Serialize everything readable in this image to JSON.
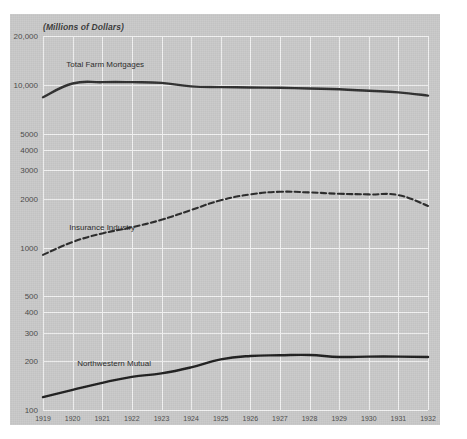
{
  "chart_data": {
    "type": "line",
    "title": "",
    "subtitle": "(Millions of Dollars)",
    "xlabel": "",
    "ylabel": "(Millions of Dollars)",
    "yscale": "log",
    "ylim": [
      100,
      20000
    ],
    "ytick_labels": [
      "20,000",
      "10,000",
      "5000",
      "4000",
      "3000",
      "2000",
      "1000",
      "500",
      "400",
      "300",
      "200",
      "100"
    ],
    "ytick_values": [
      20000,
      10000,
      5000,
      4000,
      3000,
      2000,
      1000,
      500,
      400,
      300,
      200,
      100
    ],
    "grid": true,
    "legend_position": "inline-annotation",
    "categories": [
      "1919",
      "1920",
      "1921",
      "1922",
      "1923",
      "1924",
      "1925",
      "1926",
      "1927",
      "1928",
      "1929",
      "1930",
      "1931",
      "1932"
    ],
    "x": [
      1919,
      1920,
      1921,
      1922,
      1923,
      1924,
      1925,
      1926,
      1927,
      1928,
      1929,
      1930,
      1931,
      1932
    ],
    "series": [
      {
        "name": "Total Farm Mortgages",
        "style": "solid",
        "color": "#303030",
        "values": [
          8400,
          10200,
          10400,
          10400,
          10300,
          9800,
          9700,
          9650,
          9600,
          9500,
          9400,
          9200,
          9000,
          8600
        ]
      },
      {
        "name": "Insurance Industry",
        "style": "dashed",
        "color": "#2b2b2b",
        "values": [
          900,
          1080,
          1220,
          1330,
          1480,
          1700,
          1950,
          2120,
          2200,
          2180,
          2140,
          2120,
          2100,
          1800
        ]
      },
      {
        "name": "Northwestern Mutual",
        "style": "solid",
        "color": "#202020",
        "values": [
          120,
          133,
          147,
          160,
          168,
          183,
          205,
          215,
          217,
          218,
          212,
          213,
          213,
          212
        ]
      }
    ],
    "annotations": [
      {
        "text": "Total Farm Mortgages",
        "x": 1921.1,
        "y": 13400
      },
      {
        "text": "Insurance Industry",
        "x": 1921.0,
        "y": 1330
      },
      {
        "text": "Northwestern Mutual",
        "x": 1921.4,
        "y": 196
      }
    ]
  },
  "colors": {
    "page_background": "#ffffff",
    "card_background": "#cacaca",
    "gridline": "#f2f2f2",
    "axis_text": "#4a4a4a",
    "series_ink": "#2b2b2b"
  }
}
